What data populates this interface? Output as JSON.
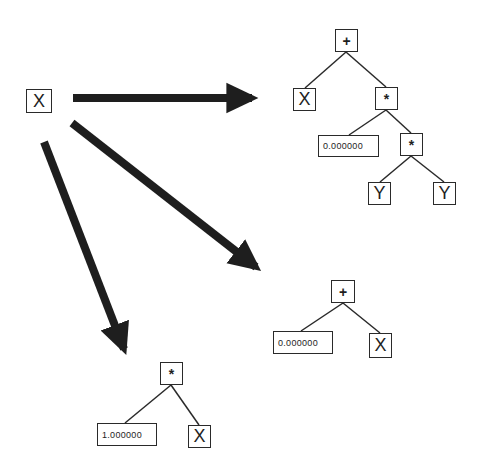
{
  "diagram": {
    "type": "expression-tree-mutation",
    "colors": {
      "ink": "#1e1e1e",
      "background": "#ffffff"
    },
    "source": {
      "label": "X"
    },
    "arrows": [
      {
        "name": "arrow-to-tree-1",
        "from": [
          73,
          98
        ],
        "to": [
          268,
          98
        ]
      },
      {
        "name": "arrow-to-tree-2",
        "from": [
          72,
          123
        ],
        "to": [
          270,
          278
        ]
      },
      {
        "name": "arrow-to-tree-3",
        "from": [
          44,
          142
        ],
        "to": [
          130,
          365
        ]
      }
    ],
    "trees": [
      {
        "name": "tree-1",
        "expression": "X + (0.000000 * (Y * Y))",
        "nodes": {
          "root": {
            "label": "+"
          },
          "left": {
            "label": "X"
          },
          "mul1": {
            "label": "*"
          },
          "const": {
            "label": "0.000000"
          },
          "mul2": {
            "label": "*"
          },
          "y1": {
            "label": "Y"
          },
          "y2": {
            "label": "Y"
          }
        }
      },
      {
        "name": "tree-2",
        "expression": "0.000000 + X",
        "nodes": {
          "root": {
            "label": "+"
          },
          "const": {
            "label": "0.000000"
          },
          "right": {
            "label": "X"
          }
        }
      },
      {
        "name": "tree-3",
        "expression": "1.000000 * X",
        "nodes": {
          "root": {
            "label": "*"
          },
          "const": {
            "label": "1.000000"
          },
          "right": {
            "label": "X"
          }
        }
      }
    ]
  }
}
